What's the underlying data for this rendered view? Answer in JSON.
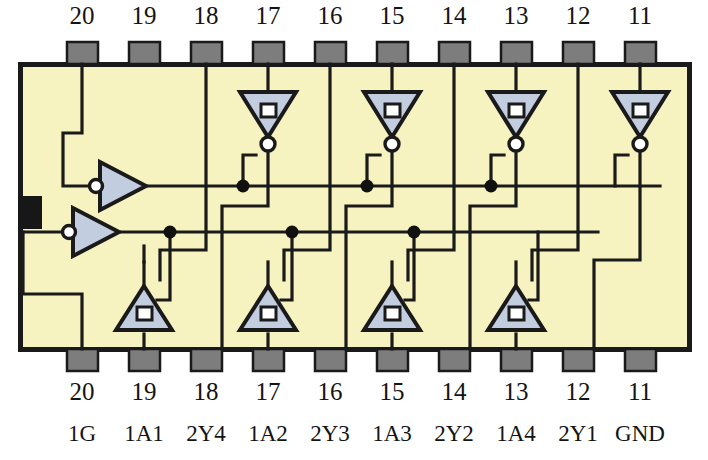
{
  "diagram": {
    "device_outline": {
      "x": 18,
      "y": 62,
      "width": 672,
      "height": 288,
      "fill": "#f7f3c0",
      "stroke": "#1a1a1a",
      "stroke_width": 5
    },
    "notch": {
      "x": 18,
      "y": 196,
      "width": 24,
      "height": 32,
      "fill": "#171717"
    },
    "pad": {
      "width": 30,
      "height": 22,
      "fill": "#7d7d7d",
      "stroke": "#1a1a1a"
    },
    "wire_color": "#1a1a1a",
    "gate_fill": "#c3cde0",
    "gate_stroke": "#1a1a1a",
    "junction_color": "#111111"
  },
  "pins": {
    "top_numbers": [
      "20",
      "19",
      "18",
      "17",
      "16",
      "15",
      "14",
      "13",
      "12",
      "11"
    ],
    "bottom_numbers": [
      "20",
      "19",
      "18",
      "17",
      "16",
      "15",
      "14",
      "13",
      "12",
      "11"
    ],
    "signal_labels": [
      "1G",
      "1A1",
      "2Y4",
      "1A2",
      "2Y3",
      "1A3",
      "2Y2",
      "1A4",
      "2Y1",
      "GND"
    ],
    "x_positions": [
      82,
      144,
      206,
      268,
      330,
      392,
      454,
      516,
      578,
      640
    ]
  },
  "gates": {
    "enable_inverters": [
      {
        "name": "inverter-1g",
        "x": 95,
        "y": 186,
        "width": 46,
        "height": 44,
        "bubble": "input"
      },
      {
        "name": "inverter-2g",
        "x": 68,
        "y": 232,
        "width": 46,
        "height": 44,
        "bubble": "input"
      }
    ],
    "top_tristate_inverting": [
      {
        "name": "tristate-inv-1",
        "cx": 268,
        "cy": 115
      },
      {
        "name": "tristate-inv-2",
        "cx": 392,
        "cy": 115
      },
      {
        "name": "tristate-inv-3",
        "cx": 516,
        "cy": 115
      },
      {
        "name": "tristate-inv-4",
        "cx": 640,
        "cy": 115
      }
    ],
    "bottom_tristate_buffers": [
      {
        "name": "tristate-buf-1",
        "cx": 144,
        "cy": 310
      },
      {
        "name": "tristate-buf-2",
        "cx": 268,
        "cy": 310
      },
      {
        "name": "tristate-buf-3",
        "cx": 392,
        "cy": 310
      },
      {
        "name": "tristate-buf-4",
        "cx": 516,
        "cy": 310
      }
    ]
  },
  "buses": {
    "upper_enable_y": 186,
    "lower_enable_y": 232,
    "upper_junctions_x": [
      243,
      367,
      491
    ],
    "lower_junctions_x": [
      170,
      292,
      414
    ]
  }
}
